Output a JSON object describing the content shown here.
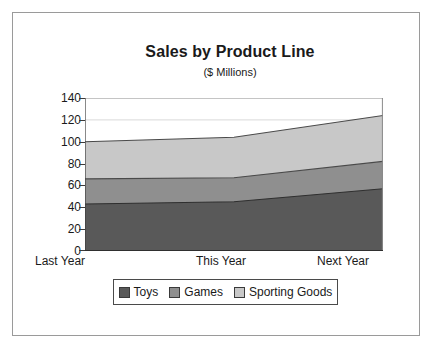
{
  "chart_data": {
    "type": "area",
    "title": "Sales by Product Line",
    "subtitle": "($ Millions)",
    "xlabel": "",
    "ylabel": "",
    "stacked": true,
    "grid": true,
    "legend_position": "bottom",
    "categories": [
      "Last Year",
      "This Year",
      "Next Year"
    ],
    "ylim": [
      0,
      140
    ],
    "yticks": [
      0,
      20,
      40,
      60,
      80,
      100,
      120,
      140
    ],
    "ytick_labels": [
      "0",
      "20",
      "40",
      "60",
      "80",
      "100",
      "120",
      "140"
    ],
    "series": [
      {
        "name": "Toys",
        "values": [
          43,
          45,
          57
        ],
        "color": "#595959"
      },
      {
        "name": "Games",
        "values": [
          23,
          22,
          25
        ],
        "color": "#8f8f8f"
      },
      {
        "name": "Sporting Goods",
        "values": [
          34,
          37,
          42
        ],
        "color": "#c8c8c8"
      }
    ],
    "cumulative": [
      {
        "name": "Toys",
        "values": [
          43,
          45,
          57
        ]
      },
      {
        "name": "Games",
        "values": [
          66,
          67,
          82
        ]
      },
      {
        "name": "Sporting Goods",
        "values": [
          100,
          104,
          124
        ]
      }
    ]
  },
  "legend": {
    "items": [
      {
        "label": "Toys"
      },
      {
        "label": "Games"
      },
      {
        "label": "Sporting Goods"
      }
    ]
  },
  "colors": {
    "toys": "#595959",
    "games": "#8f8f8f",
    "sporting_goods": "#c8c8c8",
    "axis": "#3a3a3a",
    "grid": "#d9d9d9",
    "frame": "#9a9a9a"
  }
}
